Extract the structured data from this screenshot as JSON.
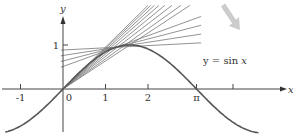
{
  "chart_data": {
    "type": "line",
    "title": "",
    "xlabel": "x",
    "ylabel": "y",
    "function": "y = sin x",
    "curve_label": {
      "prefix": "y = sin ",
      "var": "x"
    },
    "xlim": [
      -1.4,
      4.9
    ],
    "ylim": [
      -1.0,
      1.9
    ],
    "x_ticks": [
      {
        "value": -1,
        "label": "-1"
      },
      {
        "value": 0,
        "label": "0"
      },
      {
        "value": 1,
        "label": "1"
      },
      {
        "value": 2,
        "label": "2"
      },
      {
        "value": 3.1416,
        "label": "π"
      },
      {
        "value": 4,
        "label": ""
      }
    ],
    "y_ticks": [
      {
        "value": 1,
        "label": "1"
      }
    ],
    "series": [
      {
        "name": "y = sin x",
        "x_range": [
          -1.36,
          4.6
        ],
        "color": "#555555"
      }
    ],
    "secant_lines": {
      "description": "Family of secant/tangent lines through points on the curve, rotating toward the horizontal tangent at x = π/2",
      "anchor_x": 0.0,
      "through_x": [
        0.55,
        0.7,
        0.85,
        1.0,
        1.15,
        1.3,
        1.45,
        1.5708
      ],
      "color": "#777777"
    },
    "annotation_arrow": {
      "description": "Shaded arrow indicating rotation of lines",
      "from": [
        223,
        5
      ],
      "to": [
        238,
        28
      ],
      "color": "#cccccc"
    },
    "grid": false,
    "legend": null
  },
  "colors": {
    "axis": "#444444",
    "curve": "#555555",
    "lines": "#7a7a7a",
    "arrow": "#cfcfcf"
  }
}
